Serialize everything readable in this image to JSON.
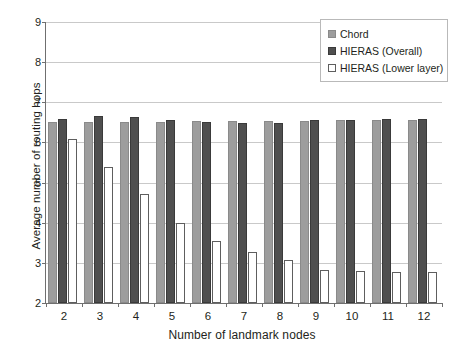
{
  "chart_data": {
    "type": "bar",
    "title": "",
    "xlabel": "Number of landmark nodes",
    "ylabel": "Average number of routing hops",
    "categories": [
      "2",
      "3",
      "4",
      "5",
      "6",
      "7",
      "8",
      "9",
      "10",
      "11",
      "12"
    ],
    "ylim": [
      2,
      9
    ],
    "yticks": [
      "2",
      "3",
      "4",
      "5",
      "6",
      "7",
      "8",
      "9"
    ],
    "grid": true,
    "legend_position": "top-right",
    "series": [
      {
        "name": "Chord",
        "color": "#9d9d9d",
        "values": [
          6.51,
          6.52,
          6.52,
          6.52,
          6.53,
          6.54,
          6.54,
          6.54,
          6.55,
          6.55,
          6.55
        ]
      },
      {
        "name": "HIERAS (Overall)",
        "color": "#4f4f4f",
        "values": [
          6.59,
          6.66,
          6.63,
          6.55,
          6.51,
          6.49,
          6.49,
          6.57,
          6.57,
          6.58,
          6.58
        ]
      },
      {
        "name": "HIERAS (Lower layer)",
        "color": "#ffffff",
        "values": [
          6.08,
          5.38,
          4.72,
          4.0,
          3.55,
          3.26,
          3.08,
          2.82,
          2.8,
          2.78,
          2.78
        ]
      }
    ]
  },
  "legend": {
    "items": [
      {
        "label": "Chord"
      },
      {
        "label": "HIERAS (Overall)"
      },
      {
        "label": "HIERAS (Lower layer)"
      }
    ]
  }
}
